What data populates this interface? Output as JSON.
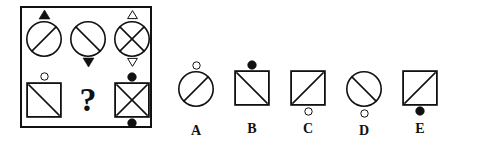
{
  "puzzle": {
    "type": "visual-analogy-matrix",
    "colors": {
      "stroke": "#111111",
      "fill_solid": "#111111",
      "fill_hollow": "#ffffff",
      "background": "#ffffff"
    },
    "matrix": {
      "rows": 2,
      "columns": 3,
      "cells": [
        {
          "id": "cell-1",
          "position": "row1-col1",
          "shape": "circle",
          "inner": "diagonal-up",
          "marker_above": "triangle-up-filled",
          "marker_below": "none"
        },
        {
          "id": "cell-2",
          "position": "row1-col2",
          "shape": "circle",
          "inner": "diagonal-down",
          "marker_above": "none",
          "marker_below": "triangle-down-filled"
        },
        {
          "id": "cell-3",
          "position": "row1-col3",
          "shape": "circle",
          "inner": "cross-x",
          "marker_above": "triangle-up-hollow",
          "marker_below": "triangle-down-hollow"
        },
        {
          "id": "cell-4",
          "position": "row2-col1",
          "shape": "square",
          "inner": "diagonal-down",
          "marker_above": "circle-hollow",
          "marker_below": "none"
        },
        {
          "id": "cell-5",
          "position": "row2-col2",
          "shape": "question-mark",
          "inner": "none",
          "marker_above": "none",
          "marker_below": "none",
          "label": "?"
        },
        {
          "id": "cell-6",
          "position": "row2-col3",
          "shape": "square",
          "inner": "cross-x",
          "marker_above": "circle-filled",
          "marker_below": "circle-filled"
        }
      ]
    },
    "options": [
      {
        "id": "option-a",
        "label": "A",
        "shape": "circle",
        "inner": "diagonal-up",
        "marker_above": "circle-hollow",
        "marker_below": "none"
      },
      {
        "id": "option-b",
        "label": "B",
        "shape": "square",
        "inner": "diagonal-down",
        "marker_above": "circle-filled",
        "marker_below": "none"
      },
      {
        "id": "option-c",
        "label": "C",
        "shape": "square",
        "inner": "diagonal-up",
        "marker_above": "none",
        "marker_below": "circle-hollow"
      },
      {
        "id": "option-d",
        "label": "D",
        "shape": "circle",
        "inner": "diagonal-down",
        "marker_above": "none",
        "marker_below": "circle-hollow"
      },
      {
        "id": "option-e",
        "label": "E",
        "shape": "square",
        "inner": "diagonal-up",
        "marker_above": "none",
        "marker_below": "circle-filled"
      }
    ]
  }
}
